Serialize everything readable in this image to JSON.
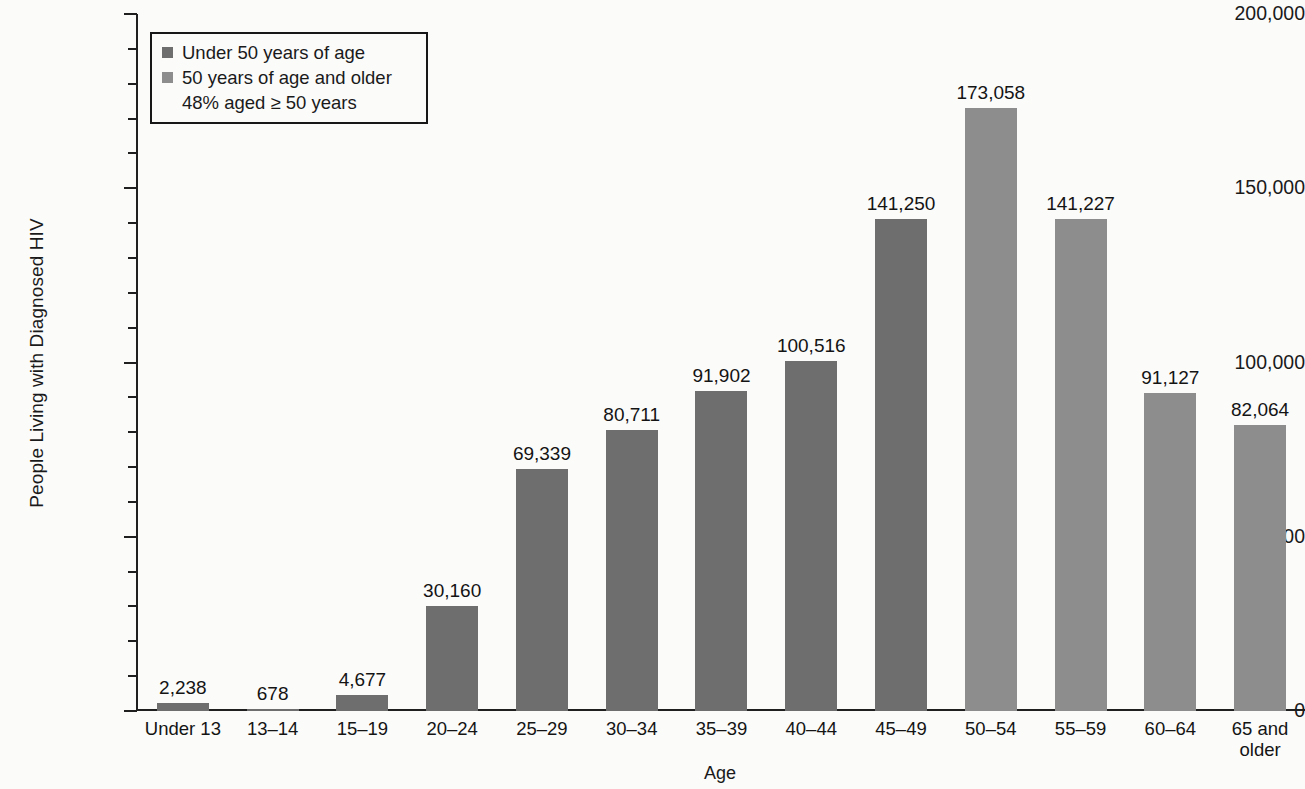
{
  "chart_data": {
    "type": "bar",
    "title": "",
    "xlabel": "Age",
    "ylabel": "People Living with Diagnosed HIV",
    "ylim": [
      0,
      200000
    ],
    "ytick_major_step": 50000,
    "ytick_minor_step": 10000,
    "grid": false,
    "legend_position": "top-left",
    "categories": [
      "Under 13",
      "13–14",
      "15–19",
      "20–24",
      "25–29",
      "30–34",
      "35–39",
      "40–44",
      "45–49",
      "50–54",
      "55–59",
      "60–64",
      "65 and\nolder"
    ],
    "category_labels": [
      [
        "Under 13"
      ],
      [
        "13–14"
      ],
      [
        "15–19"
      ],
      [
        "20–24"
      ],
      [
        "25–29"
      ],
      [
        "30–34"
      ],
      [
        "35–39"
      ],
      [
        "40–44"
      ],
      [
        "45–49"
      ],
      [
        "50–54"
      ],
      [
        "55–59"
      ],
      [
        "60–64"
      ],
      [
        "65 and",
        "older"
      ]
    ],
    "values": [
      2238,
      678,
      4677,
      30160,
      69339,
      80711,
      91902,
      100516,
      141250,
      173058,
      141227,
      91127,
      82064
    ],
    "value_labels": [
      "2,238",
      "678",
      "4,677",
      "30,160",
      "69,339",
      "80,711",
      "91,902",
      "100,516",
      "141,250",
      "173,058",
      "141,227",
      "91,127",
      "82,064"
    ],
    "groups": [
      "under50",
      "under50",
      "under50",
      "under50",
      "under50",
      "under50",
      "under50",
      "under50",
      "under50",
      "over50",
      "over50",
      "over50",
      "over50"
    ],
    "ytick_labels": [
      "200,000",
      "150,000",
      "100,000",
      "50,000",
      "0"
    ],
    "ytick_values": [
      200000,
      150000,
      100000,
      50000,
      0
    ],
    "colors": {
      "under50": "#6e6e6e",
      "over50": "#8d8d8d",
      "axis": "#1f1f1f",
      "text": "#141414",
      "background": "#fbfbfa"
    }
  },
  "legend": {
    "series": [
      {
        "label": "Under 50 years of age",
        "group": "under50"
      },
      {
        "label": "50 years of age and older",
        "group": "over50"
      }
    ],
    "note": "48% aged ≥ 50 years"
  },
  "axes": {
    "y_title": "People Living with Diagnosed HIV",
    "x_title": "Age"
  }
}
